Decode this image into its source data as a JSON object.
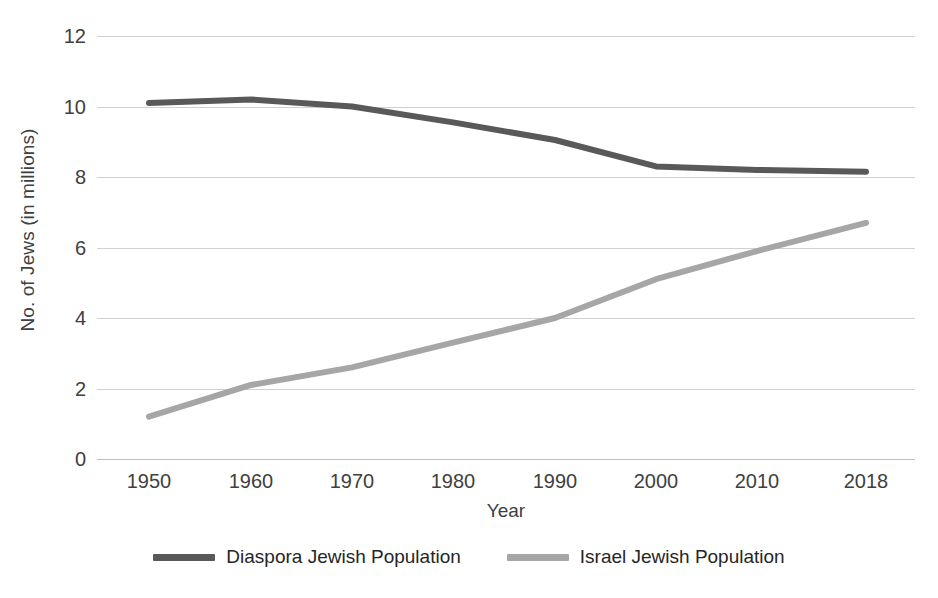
{
  "chart_data": {
    "type": "line",
    "title": "",
    "xlabel": "Year",
    "ylabel": "No. of Jews (in millions)",
    "categories": [
      "1950",
      "1960",
      "1970",
      "1980",
      "1990",
      "2000",
      "2010",
      "2018"
    ],
    "x": [
      1950,
      1960,
      1970,
      1980,
      1990,
      2000,
      2010,
      2018
    ],
    "series": [
      {
        "name": "Diaspora Jewish Population",
        "color": "#595959",
        "values": [
          10.1,
          10.2,
          10.0,
          9.55,
          9.05,
          8.3,
          8.2,
          8.15
        ]
      },
      {
        "name": "Israel Jewish Population",
        "color": "#a6a6a6",
        "values": [
          1.2,
          2.1,
          2.6,
          3.3,
          4.0,
          5.1,
          5.9,
          6.7
        ]
      }
    ],
    "ylim": [
      0,
      12
    ],
    "y_ticks": [
      0,
      2,
      4,
      6,
      8,
      10,
      12
    ],
    "y_tick_labels": [
      "0",
      "2",
      "4",
      "6",
      "8",
      "10",
      "12"
    ],
    "grid": true,
    "gridline_color": "#d0d0d0",
    "legend_position": "bottom",
    "background": "#ffffff",
    "line_width": 6
  },
  "axes": {
    "y_title": "No. of Jews (in millions)",
    "x_title": "Year"
  },
  "legend": {
    "items": [
      {
        "label": "Diaspora Jewish Population",
        "color": "#595959"
      },
      {
        "label": "Israel Jewish Population",
        "color": "#a6a6a6"
      }
    ]
  }
}
